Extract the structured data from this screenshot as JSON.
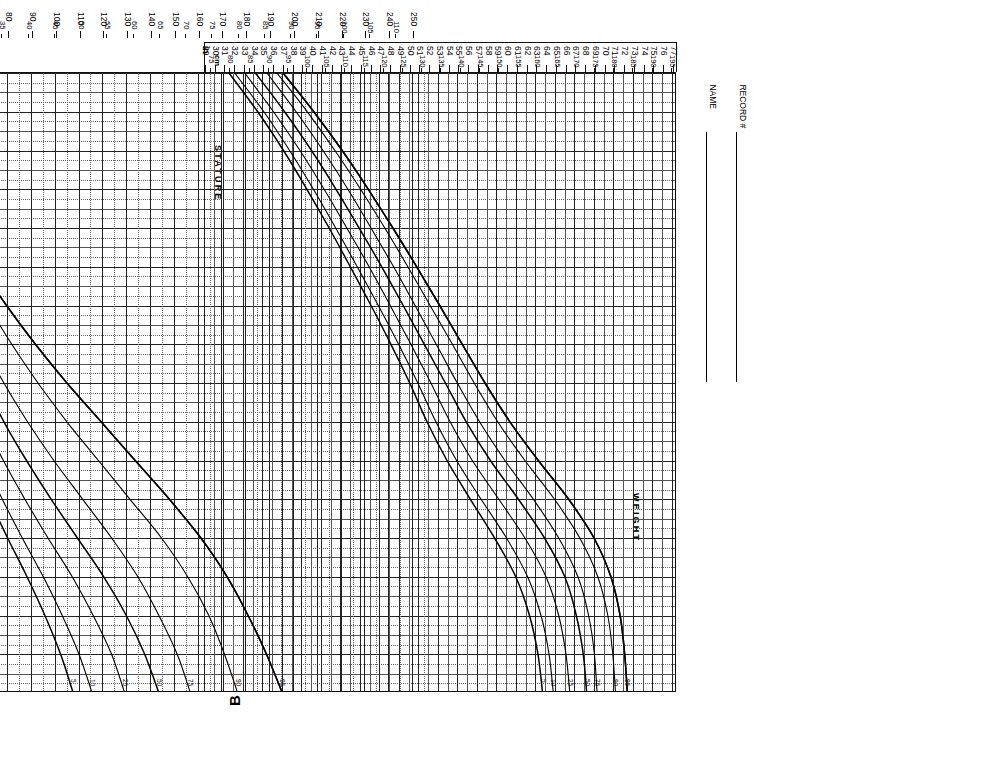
{
  "document": {
    "title_lines": [
      "BOYS: 2 TO 18 YEARS",
      "PHYSICAL GROWTH",
      "NCHS PERCENTILES*"
    ],
    "sheet_letter": "B"
  },
  "form_fields": [
    {
      "label": "NAME"
    },
    {
      "label": "RECORD #"
    }
  ],
  "axes": {
    "age": {
      "title": "AGE (YEARS)",
      "unit": "years",
      "ticks": [
        "2",
        "3",
        "4",
        "5",
        "6",
        "7",
        "8",
        "9",
        "10",
        "11",
        "12",
        "13",
        "14",
        "15",
        "16",
        "17",
        "18"
      ],
      "min": 2,
      "max": 18
    },
    "stature": {
      "title": "STATURE",
      "in_label": "in",
      "cm_label": "cm",
      "in_ticks": [
        "29",
        "30",
        "31",
        "32",
        "33",
        "34",
        "35",
        "36",
        "37",
        "38",
        "39",
        "40",
        "41",
        "42",
        "43",
        "44",
        "45",
        "46",
        "47",
        "48",
        "49",
        "50",
        "51",
        "52",
        "53",
        "54",
        "55",
        "56",
        "57",
        "58",
        "59",
        "60",
        "61",
        "62",
        "63",
        "64",
        "65",
        "66",
        "67",
        "68",
        "69",
        "70",
        "71",
        "72",
        "73",
        "74",
        "75",
        "76",
        "77"
      ],
      "cm_ticks": [
        "75",
        "80",
        "85",
        "90",
        "95",
        "100",
        "105",
        "110",
        "115",
        "120",
        "125",
        "130",
        "135",
        "140",
        "145",
        "150",
        "155",
        "160",
        "165",
        "170",
        "175",
        "180",
        "185",
        "190",
        "195"
      ],
      "in_min": 29,
      "in_max": 77,
      "cm_min": 73.66,
      "cm_max": 195.58
    },
    "weight": {
      "title": "WEIGHT",
      "lb_label": "lb",
      "kg_label": "kg",
      "lb_ticks": [
        "30",
        "40",
        "50",
        "60",
        "70",
        "80",
        "90",
        "100",
        "110",
        "120",
        "130",
        "140",
        "150",
        "160",
        "170",
        "180",
        "190",
        "200",
        "210",
        "220",
        "230",
        "240",
        "250"
      ],
      "kg_ticks": [
        "15",
        "20",
        "25",
        "30",
        "35",
        "40",
        "45",
        "50",
        "55",
        "60",
        "65",
        "70",
        "75",
        "80",
        "85",
        "90",
        "95",
        "100",
        "105",
        "110"
      ],
      "lb_min": 25,
      "lb_max": 255,
      "kg_min": 11.34,
      "kg_max": 115.67
    }
  },
  "percentile_labels": [
    "95",
    "90",
    "75",
    "50",
    "25",
    "10",
    "5"
  ],
  "colors": {
    "shade": "#d9d9d9",
    "grid_minor": "#555555",
    "grid_major": "#222222",
    "curve": "#000000",
    "paper": "#ffffff"
  },
  "chart_data": {
    "type": "line",
    "title": "BOYS: 2 TO 18 YEARS PHYSICAL GROWTH NCHS PERCENTILES",
    "xlabel": "AGE (YEARS)",
    "ylabel": "STATURE (in / cm) and WEIGHT (lb / kg)",
    "x": [
      2,
      3,
      4,
      5,
      6,
      7,
      8,
      9,
      10,
      11,
      12,
      13,
      14,
      15,
      16,
      17,
      18
    ],
    "xlim": [
      2,
      18
    ],
    "grid": true,
    "legend": "curve-end percentile labels",
    "panels": [
      {
        "name": "stature",
        "unit": "cm",
        "ylim": [
          73.66,
          195.58
        ],
        "series": [
          {
            "name": "95",
            "values": [
              94.0,
              102.0,
              109.4,
              116.2,
              122.6,
              128.8,
              134.8,
              140.7,
              146.6,
              153.1,
              160.5,
              168.4,
              175.0,
              179.4,
              181.8,
              183.0,
              183.7
            ]
          },
          {
            "name": "90",
            "values": [
              92.4,
              100.3,
              107.5,
              114.2,
              120.5,
              126.5,
              132.3,
              138.1,
              143.8,
              149.9,
              157.0,
              164.7,
              171.3,
              176.0,
              178.6,
              179.9,
              180.6
            ]
          },
          {
            "name": "75",
            "values": [
              89.8,
              97.4,
              104.4,
              110.9,
              116.9,
              122.8,
              128.4,
              133.9,
              139.4,
              145.2,
              151.8,
              159.2,
              165.8,
              170.8,
              173.6,
              175.1,
              175.8
            ]
          },
          {
            "name": "50",
            "values": [
              86.8,
              94.4,
              101.4,
              107.8,
              113.8,
              119.7,
              125.3,
              130.8,
              136.3,
              141.7,
              148.0,
              155.3,
              162.1,
              167.4,
              170.4,
              172.2,
              173.1
            ]
          },
          {
            "name": "25",
            "values": [
              84.0,
              91.5,
              98.4,
              104.7,
              110.6,
              116.4,
              121.9,
              127.3,
              132.5,
              137.5,
              143.3,
              150.2,
              157.0,
              162.5,
              165.8,
              167.7,
              168.7
            ]
          },
          {
            "name": "10",
            "values": [
              81.4,
              89.0,
              95.7,
              101.9,
              107.7,
              113.3,
              118.8,
              124.1,
              129.1,
              133.8,
              139.2,
              145.6,
              152.2,
              157.7,
              161.2,
              163.3,
              164.4
            ]
          },
          {
            "name": "5",
            "values": [
              79.9,
              87.4,
              94.1,
              100.2,
              106.0,
              111.5,
              116.9,
              122.1,
              127.0,
              131.5,
              136.7,
              142.8,
              149.1,
              154.6,
              158.2,
              160.4,
              161.6
            ]
          }
        ]
      },
      {
        "name": "weight",
        "unit": "kg",
        "ylim": [
          11.34,
          115.67
        ],
        "series": [
          {
            "name": "95",
            "values": [
              15.5,
              18.0,
              20.5,
              23.5,
              27.0,
              31.0,
              36.0,
              41.5,
              47.5,
              54.0,
              60.5,
              67.0,
              73.0,
              78.0,
              82.0,
              85.5,
              88.5
            ]
          },
          {
            "name": "90",
            "values": [
              14.8,
              17.0,
              19.3,
              22.0,
              25.0,
              28.5,
              32.5,
              37.0,
              42.0,
              47.5,
              53.5,
              59.5,
              65.5,
              70.5,
              74.5,
              77.5,
              80.0
            ]
          },
          {
            "name": "75",
            "values": [
              13.7,
              15.7,
              17.7,
              19.8,
              22.2,
              25.0,
              28.0,
              31.5,
              35.5,
              40.0,
              45.0,
              50.5,
              56.0,
              61.0,
              65.0,
              68.5,
              71.0
            ]
          },
          {
            "name": "50",
            "values": [
              12.6,
              14.6,
              16.4,
              18.4,
              20.6,
              23.0,
              25.7,
              28.5,
              31.8,
              35.5,
              39.8,
              44.5,
              49.5,
              54.5,
              58.8,
              62.3,
              65.0
            ]
          },
          {
            "name": "25",
            "values": [
              11.7,
              13.5,
              15.2,
              17.0,
              18.9,
              21.0,
              23.3,
              25.8,
              28.6,
              31.8,
              35.4,
              39.5,
              43.9,
              48.5,
              52.5,
              56.0,
              58.5
            ]
          },
          {
            "name": "10",
            "values": [
              10.9,
              12.6,
              14.2,
              15.8,
              17.5,
              19.3,
              21.3,
              23.5,
              25.9,
              28.6,
              31.7,
              35.2,
              39.0,
              43.0,
              46.6,
              49.8,
              52.3
            ]
          },
          {
            "name": "5",
            "values": [
              10.5,
              12.0,
              13.6,
              15.0,
              16.6,
              18.3,
              20.1,
              22.1,
              24.3,
              26.7,
              29.5,
              32.7,
              36.2,
              39.9,
              43.3,
              46.3,
              48.7
            ]
          }
        ]
      }
    ]
  }
}
